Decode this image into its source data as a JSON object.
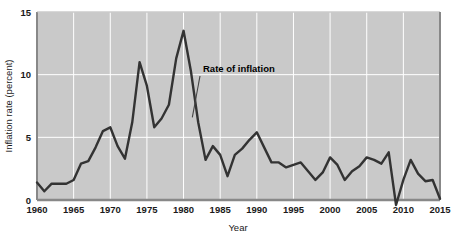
{
  "chart_data": {
    "type": "line",
    "title": "",
    "xlabel": "Year",
    "ylabel": "Inflation rate (percent)",
    "xlim": [
      1960,
      2015
    ],
    "ylim": [
      0,
      15
    ],
    "ytick_labels": [
      "0",
      "5",
      "10",
      "15"
    ],
    "yticks": [
      0,
      5,
      10,
      15
    ],
    "xtick_labels": [
      "1960",
      "1965",
      "1970",
      "1975",
      "1980",
      "1985",
      "1990",
      "1995",
      "2000",
      "2005",
      "2010",
      "2015"
    ],
    "xticks": [
      1960,
      1965,
      1970,
      1975,
      1980,
      1985,
      1990,
      1995,
      2000,
      2005,
      2010,
      2015
    ],
    "grid": true,
    "grid_color": "#ffffff",
    "plot_background": "#c9c9c9",
    "line_color": "#333333",
    "legend": "none",
    "annotations": [
      {
        "text": "Rate of inflation",
        "label_x": 2015,
        "label_y": 15,
        "pointer_from": [
          1993,
          9.6
        ],
        "pointer_to": [
          1981.2,
          6.6
        ]
      }
    ],
    "series": [
      {
        "name": "Rate of inflation",
        "x": [
          1960,
          1961,
          1962,
          1963,
          1964,
          1965,
          1966,
          1967,
          1968,
          1969,
          1970,
          1971,
          1972,
          1973,
          1974,
          1975,
          1976,
          1977,
          1978,
          1979,
          1980,
          1981,
          1982,
          1983,
          1984,
          1985,
          1986,
          1987,
          1988,
          1989,
          1990,
          1991,
          1992,
          1993,
          1994,
          1995,
          1996,
          1997,
          1998,
          1999,
          2000,
          2001,
          2002,
          2003,
          2004,
          2005,
          2006,
          2007,
          2008,
          2009,
          2010,
          2011,
          2012,
          2013,
          2014,
          2015
        ],
        "values": [
          1.4,
          0.7,
          1.3,
          1.3,
          1.3,
          1.6,
          2.9,
          3.1,
          4.2,
          5.5,
          5.8,
          4.3,
          3.3,
          6.2,
          11.0,
          9.1,
          5.8,
          6.5,
          7.6,
          11.3,
          13.5,
          10.3,
          6.2,
          3.2,
          4.3,
          3.6,
          1.9,
          3.6,
          4.1,
          4.8,
          5.4,
          4.2,
          3.0,
          3.0,
          2.6,
          2.8,
          3.0,
          2.3,
          1.6,
          2.2,
          3.4,
          2.8,
          1.6,
          2.3,
          2.7,
          3.4,
          3.2,
          2.9,
          3.8,
          -0.4,
          1.6,
          3.2,
          2.1,
          1.5,
          1.6,
          0.1
        ]
      }
    ]
  }
}
